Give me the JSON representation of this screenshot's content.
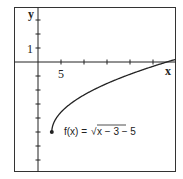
{
  "chart_data": {
    "type": "line",
    "title": "",
    "xlabel": "x",
    "ylabel": "y",
    "x_tick_step": 5,
    "y_tick_step": 1,
    "x_tick_labels": [
      {
        "value": 5,
        "label": "5"
      }
    ],
    "y_tick_labels": [
      {
        "value": 1,
        "label": "1"
      }
    ],
    "xlim": [
      -5,
      30
    ],
    "ylim": [
      -8,
      3
    ],
    "grid": false,
    "series": [
      {
        "name": "f(x) = √(x − 3) − 5",
        "function": "sqrt(x-3)-5",
        "domain_start": 3,
        "start_point": {
          "x": 3,
          "y": -5,
          "marker": "filled-dot"
        },
        "x_intercept": 28,
        "x": [
          3,
          3.25,
          4,
          5,
          7,
          10,
          14,
          19,
          24,
          28,
          30
        ],
        "y": [
          -5,
          -4.5,
          -4,
          -3.59,
          -3,
          -2.35,
          -1.68,
          -1,
          -0.42,
          0,
          0.2
        ]
      }
    ],
    "annotations": [
      {
        "text": "f(x) = √x − 3 − 5",
        "position": "right of start point"
      }
    ],
    "colors": {
      "curve": "#222222",
      "axes": "#222222",
      "frame": "#333333"
    }
  },
  "labels": {
    "x_axis": "x",
    "y_axis": "y",
    "x_tick_5": "5",
    "y_tick_1": "1",
    "func_prefix": "f(x) = ",
    "func_radicand": "x − 3 − 5"
  }
}
